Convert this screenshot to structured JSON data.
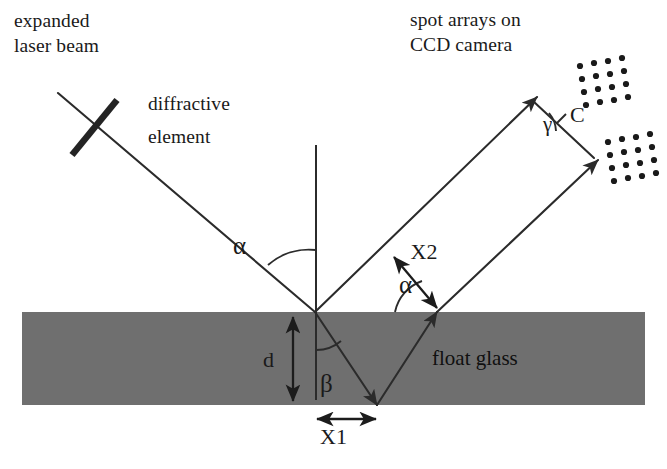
{
  "figure": {
    "background_color": "#ffffff",
    "ink_color": "#2b2b2b",
    "glass_fill_color": "#6f6f6f"
  },
  "captions": {
    "source_line1": "expanded",
    "source_line2": "laser beam",
    "element_line1": "diffractive",
    "element_line2": "element",
    "detector_line1": "spot arrays on",
    "detector_line2": "CCD camera",
    "material": "float glass"
  },
  "symbols": {
    "alpha_incident": "α",
    "alpha_exit": "α",
    "beta": "β",
    "gamma": "γ",
    "thickness": "d",
    "separation_internal": "X1",
    "separation_beams": "X2",
    "separation_ccd": "C"
  },
  "geometry": {
    "glass_slab": {
      "x": 22,
      "y": 312,
      "width": 623,
      "height": 93
    },
    "incidence_point": {
      "x": 315,
      "y": 312
    },
    "bottom_reflection_point": {
      "x": 377,
      "y": 405
    },
    "second_exit_point": {
      "x": 437,
      "y": 312
    },
    "normal_top": {
      "x": 316,
      "y": 145
    },
    "normal_bottom": {
      "x": 316,
      "y": 400
    },
    "incident_beam_start": {
      "x": 58,
      "y": 93
    },
    "grating_bar_start": {
      "x": 117,
      "y": 100
    },
    "grating_bar_end": {
      "x": 72,
      "y": 155
    },
    "reflected_beam_1_tip": {
      "x": 537,
      "y": 97
    },
    "reflected_beam_2_tip": {
      "x": 598,
      "y": 160
    },
    "angle_alpha_degrees": 45,
    "angle_beta_degrees": 28,
    "angle_gamma_degrees": 22
  },
  "spot_arrays": {
    "upper": {
      "rows": 4,
      "cols": 4,
      "center_x": 604,
      "center_y": 76,
      "spacing": 14,
      "skew": -0.18
    },
    "lower": {
      "rows": 4,
      "cols": 5,
      "center_x": 636,
      "center_y": 152,
      "spacing": 14,
      "skew": -0.18
    },
    "dot_radius": 3.1,
    "dot_color": "#1a1a1a"
  }
}
